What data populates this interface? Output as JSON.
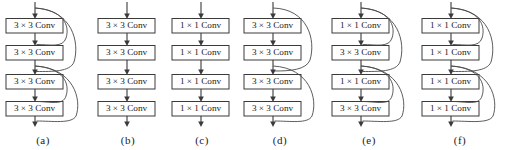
{
  "figure": {
    "background_color": "#ffffff",
    "line_color": "#3a3a3a",
    "curve_color": "#4a4a4a",
    "text_color": "#1a1a1a",
    "panel_count": 6
  },
  "panels": [
    {
      "id": "a",
      "caption": "(a)",
      "blocks": [
        {
          "label": "3 × 3 Conv"
        },
        {
          "label": "3 × 3 Conv"
        },
        {
          "label": "3 × 3 Conv"
        },
        {
          "label": "3 × 3 Conv"
        }
      ],
      "skip_connections": 4,
      "skip_pattern": "dense-double-c"
    },
    {
      "id": "b",
      "caption": "(b)",
      "blocks": [
        {
          "label": "3 × 3 Conv"
        },
        {
          "label": "3 × 3 Conv"
        },
        {
          "label": "3 × 3 Conv"
        },
        {
          "label": "3 × 3 Conv"
        }
      ],
      "skip_connections": 0,
      "skip_pattern": "none"
    },
    {
      "id": "c",
      "caption": "(c)",
      "blocks": [
        {
          "label": "1 × 1 Conv"
        },
        {
          "label": "1 × 1 Conv"
        },
        {
          "label": "1 × 1 Conv"
        },
        {
          "label": "1 × 1 Conv"
        }
      ],
      "skip_connections": 0,
      "skip_pattern": "none"
    },
    {
      "id": "d",
      "caption": "(d)",
      "blocks": [
        {
          "label": "3 × 3 Conv"
        },
        {
          "label": "3 × 3 Conv"
        },
        {
          "label": "3 × 3 Conv"
        },
        {
          "label": "3 × 3 Conv"
        }
      ],
      "skip_connections": 2,
      "skip_pattern": "residual-c"
    },
    {
      "id": "e",
      "caption": "(e)",
      "blocks": [
        {
          "label": "1 × 1 Conv"
        },
        {
          "label": "3 × 3 Conv"
        },
        {
          "label": "1 × 1 Conv"
        },
        {
          "label": "3 × 3 Conv"
        }
      ],
      "skip_connections": 4,
      "skip_pattern": "dense-double-c"
    },
    {
      "id": "f",
      "caption": "(f)",
      "blocks": [
        {
          "label": "1 × 1 Conv"
        },
        {
          "label": "1 × 1 Conv"
        },
        {
          "label": "1 × 1 Conv"
        },
        {
          "label": "1 × 1 Conv"
        }
      ],
      "skip_connections": 4,
      "skip_pattern": "dense-double-c"
    }
  ]
}
